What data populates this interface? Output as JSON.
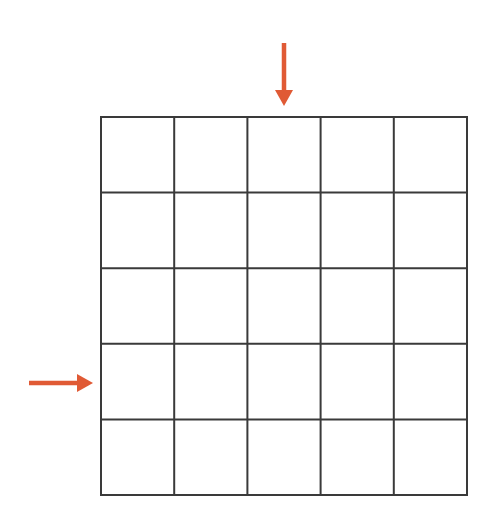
{
  "diagram": {
    "type": "grid",
    "rows": 5,
    "cols": 5,
    "grid_bounds": {
      "x": 101,
      "y": 117,
      "width": 366,
      "height": 378
    },
    "line_color": "#3a3a3a",
    "line_width": 2,
    "background": "#ffffff",
    "arrows": [
      {
        "name": "column-indicator-arrow",
        "direction": "down",
        "points_to": "column 3",
        "color": "#e05a35",
        "x1": 284,
        "y1": 43,
        "x2": 284,
        "y2": 106
      },
      {
        "name": "row-indicator-arrow",
        "direction": "right",
        "points_to": "row 4",
        "color": "#e05a35",
        "x1": 29,
        "y1": 383,
        "x2": 93,
        "y2": 383
      }
    ]
  }
}
